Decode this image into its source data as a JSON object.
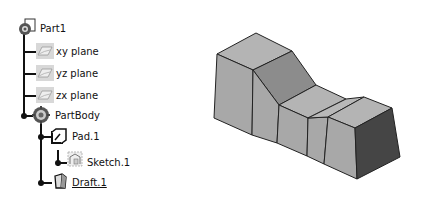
{
  "tree": {
    "root": {
      "label": "Part1",
      "icon": "part-icon"
    },
    "planes": [
      {
        "label": "xy plane",
        "icon": "plane-icon"
      },
      {
        "label": "yz plane",
        "icon": "plane-icon"
      },
      {
        "label": "zx plane",
        "icon": "plane-icon"
      }
    ],
    "body": {
      "label": "PartBody",
      "icon": "body-gear-icon"
    },
    "features": [
      {
        "label": "Pad.1",
        "icon": "pad-icon"
      },
      {
        "label": "Sketch.1",
        "icon": "sketch-icon"
      },
      {
        "label": "Draft.1",
        "icon": "draft-icon",
        "selected_underline": true
      }
    ]
  },
  "model": {
    "description": "3D solid part with draft",
    "colors": {
      "light_face": "#b4b4b4",
      "mid_face": "#9c9c9c",
      "dark_face": "#6e6e6e",
      "darkest_face": "#454545",
      "edge": "#222222"
    }
  }
}
